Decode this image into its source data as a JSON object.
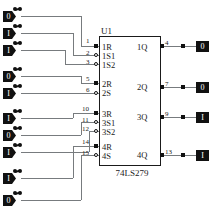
{
  "diagram": {
    "ic": {
      "reference": "U1",
      "part_number": "74LS279",
      "input_groups": [
        {
          "pins": [
            {
              "number": "1",
              "label": "1R",
              "inverted": false
            },
            {
              "number": "2",
              "label": "1S1",
              "inverted": true
            },
            {
              "number": "3",
              "label": "1S2",
              "inverted": true
            }
          ],
          "output": {
            "number": "4",
            "label": "1Q"
          }
        },
        {
          "pins": [
            {
              "number": "5",
              "label": "2R",
              "inverted": false
            },
            {
              "number": "6",
              "label": "2S",
              "inverted": true
            }
          ],
          "output": {
            "number": "7",
            "label": "2Q"
          }
        },
        {
          "pins": [
            {
              "number": "10",
              "label": "3R",
              "inverted": false
            },
            {
              "number": "11",
              "label": "3S1",
              "inverted": true
            },
            {
              "number": "12",
              "label": "3S2",
              "inverted": true
            }
          ],
          "output": {
            "number": "9",
            "label": "3Q"
          }
        },
        {
          "pins": [
            {
              "number": "14",
              "label": "4R",
              "inverted": false
            },
            {
              "number": "15",
              "label": "4S",
              "inverted": true
            }
          ],
          "output": {
            "number": "13",
            "label": "4Q"
          }
        }
      ]
    },
    "input_switches": [
      {
        "id": "sw1",
        "value": "0",
        "connects_to": "1"
      },
      {
        "id": "sw2",
        "value": "I",
        "connects_to": "2"
      },
      {
        "id": "sw3",
        "value": "I",
        "connects_to": "3"
      },
      {
        "id": "sw4",
        "value": "0",
        "connects_to": "5"
      },
      {
        "id": "sw5",
        "value": "I",
        "connects_to": "6"
      },
      {
        "id": "sw6",
        "value": "I",
        "connects_to": "10"
      },
      {
        "id": "sw7",
        "value": "0",
        "connects_to": "11"
      },
      {
        "id": "sw8",
        "value": "I",
        "connects_to": "12"
      },
      {
        "id": "sw9",
        "value": "I",
        "connects_to": "14"
      },
      {
        "id": "sw10",
        "value": "0",
        "connects_to": "15"
      }
    ],
    "output_probes": [
      {
        "id": "p1",
        "value": "0",
        "pin": "4"
      },
      {
        "id": "p2",
        "value": "0",
        "pin": "7"
      },
      {
        "id": "p3",
        "value": "I",
        "pin": "9"
      },
      {
        "id": "p4",
        "value": "I",
        "pin": "13"
      }
    ]
  }
}
